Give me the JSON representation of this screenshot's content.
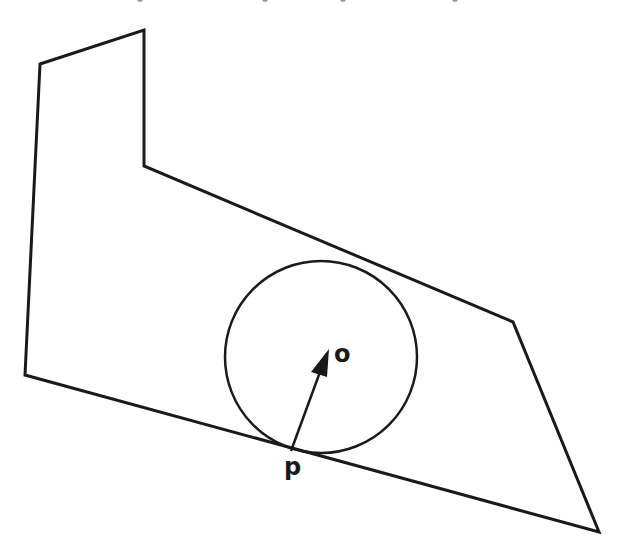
{
  "diagram": {
    "polygon_points": [
      [
        40,
        64
      ],
      [
        144,
        30
      ],
      [
        144,
        166
      ],
      [
        513,
        322
      ],
      [
        599,
        532
      ],
      [
        25,
        375
      ]
    ],
    "circle": {
      "cx": 321,
      "cy": 357,
      "r": 96
    },
    "arrow": {
      "from": [
        291,
        451
      ],
      "to": [
        329,
        349
      ]
    },
    "labels": {
      "center": "o",
      "tangent_point": "p"
    },
    "stroke_color": "#1a1a1a",
    "cut_off_top_marks_x": [
      137,
      262,
      340,
      452
    ]
  }
}
